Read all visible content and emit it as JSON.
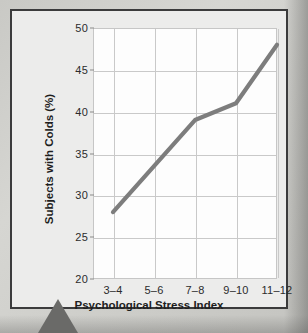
{
  "figure": {
    "background_color": "#ececeb",
    "frame_color": "#3b3b3c",
    "plot_background": "#fdfdfd",
    "grid_color": "#c9c9c9",
    "line_color": "#7d7d7d"
  },
  "chart_data": {
    "type": "line",
    "title": "",
    "subtitle": "",
    "xlabel": "Psychological Stress Index",
    "ylabel": "Subjects with Colds (%)",
    "categories": [
      "3–4",
      "5–6",
      "7–8",
      "9–10",
      "11–12"
    ],
    "values": [
      28,
      33.5,
      39,
      41,
      48
    ],
    "ylim": [
      20,
      50
    ],
    "yticks": [
      20,
      25,
      30,
      35,
      40,
      45,
      50
    ],
    "ytick_labels": [
      "20",
      "25",
      "30",
      "35",
      "40",
      "45",
      "50"
    ],
    "grid": true,
    "legend": null,
    "legend_position": "none",
    "series": [
      {
        "name": "Subjects with Colds (%)",
        "values": [
          28,
          33.5,
          39,
          41,
          48
        ],
        "color": "#7d7d7d"
      }
    ],
    "annotations": []
  }
}
